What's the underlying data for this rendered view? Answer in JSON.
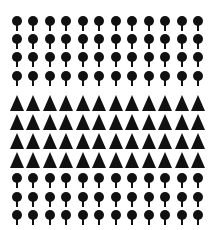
{
  "figure": {
    "columns": 12,
    "column_x": [
      17,
      33,
      50,
      66,
      83,
      99,
      116,
      132,
      149,
      165,
      182,
      198
    ],
    "rows": [
      {
        "shape": "pin",
        "y": 21
      },
      {
        "shape": "pin",
        "y": 39
      },
      {
        "shape": "pin",
        "y": 57
      },
      {
        "shape": "pin",
        "y": 76
      },
      {
        "shape": "triangle",
        "y": 103
      },
      {
        "shape": "triangle",
        "y": 122
      },
      {
        "shape": "triangle",
        "y": 141
      },
      {
        "shape": "triangle",
        "y": 160
      },
      {
        "shape": "pin",
        "y": 178
      },
      {
        "shape": "pin",
        "y": 197
      },
      {
        "shape": "pin",
        "y": 215
      }
    ],
    "counts": {
      "pin_rows_top": 4,
      "triangle_rows": 4,
      "pin_rows_bottom": 3,
      "total_pins": 84,
      "total_triangles": 48
    },
    "colors": {
      "shape": "#111111",
      "background": "#ffffff"
    }
  }
}
